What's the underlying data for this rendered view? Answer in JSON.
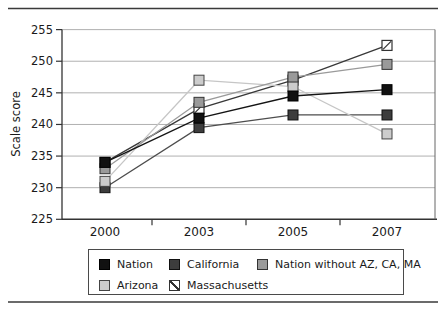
{
  "chart_data": {
    "type": "line",
    "title": "",
    "xlabel": "",
    "ylabel": "Scale score",
    "x_categories": [
      "2000",
      "2003",
      "2005",
      "2007"
    ],
    "y_ticks": [
      255,
      250,
      245,
      240,
      235,
      230,
      225
    ],
    "ylim": [
      225,
      255
    ],
    "grid": "horizontal",
    "legend_position": "bottom",
    "series": [
      {
        "name": "Nation",
        "marker": "solid-black-square",
        "line_color": "#141414",
        "fill": "#111111",
        "edge": "#000000",
        "z": 5,
        "values": [
          234,
          241,
          244.5,
          245.5
        ]
      },
      {
        "name": "California",
        "marker": "dark-gray-square",
        "line_color": "#4d4d4d",
        "fill": "#3d3d3d",
        "edge": "#111111",
        "z": 2,
        "values": [
          230,
          239.5,
          241.5,
          241.5
        ]
      },
      {
        "name": "Nation without AZ, CA, MA",
        "marker": "medium-gray-square",
        "line_color": "#9a9a9a",
        "fill": "#9a9a9a",
        "edge": "#333333",
        "z": 4,
        "values": [
          233,
          243.5,
          247.5,
          249.5
        ]
      },
      {
        "name": "Arizona",
        "marker": "light-gray-square",
        "line_color": "#c6c6c6",
        "fill": "#cccccc",
        "edge": "#444444",
        "z": 3,
        "values": [
          231,
          247,
          246,
          238.5
        ]
      },
      {
        "name": "Massachusetts",
        "marker": "white-diagonal-hatch-square",
        "line_color": "#383838",
        "fill": "hatch",
        "edge": "#333333",
        "z": 1,
        "values": [
          234,
          242.5,
          247,
          252.5
        ]
      }
    ],
    "legend_rows": [
      [
        0,
        1,
        2
      ],
      [
        3,
        4
      ]
    ]
  },
  "colors": {
    "axis": "#333333",
    "gridline": "#b0b0b0",
    "rule": "#3a3a3a",
    "text": "#1a1a1a"
  }
}
